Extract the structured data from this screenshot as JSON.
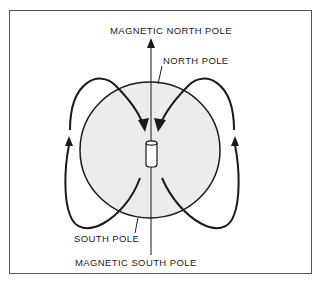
{
  "diagram": {
    "type": "magnetic field of the earth",
    "labels": {
      "magnetic_north_pole": "MAGNETIC NORTH POLE",
      "north_pole": "NORTH POLE",
      "south_pole": "SOUTH POLE",
      "magnetic_south_pole": "MAGNETIC SOUTH POLE"
    },
    "elements": {
      "sphere": "earth-globe",
      "magnet": "bar-magnet",
      "axis": "magnetic-axis",
      "field_lines": [
        "left-field-loop",
        "right-field-loop"
      ]
    },
    "colors": {
      "line": "#1a1a1a",
      "sphere_fill": "#ebebeb",
      "frame": "#555555"
    }
  }
}
